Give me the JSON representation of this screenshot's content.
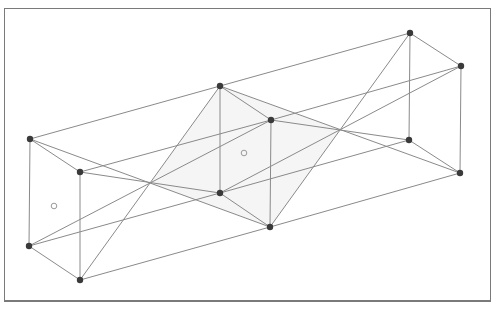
{
  "diagram": {
    "title": "",
    "frame": {
      "stroke": "#7a7a7a"
    },
    "colors": {
      "edge": "#8a8a8a",
      "vertex": "#3a3a3a",
      "shade": "#ececec",
      "marker": "#9a9a9a"
    },
    "vertices": {
      "A": [
        30,
        139
      ],
      "B": [
        220,
        86
      ],
      "C": [
        410,
        33
      ],
      "D": [
        461,
        66
      ],
      "E": [
        80,
        172
      ],
      "F": [
        271,
        120
      ],
      "J": [
        29,
        246
      ],
      "G": [
        220,
        193
      ],
      "H": [
        409,
        140
      ],
      "I": [
        460,
        173
      ],
      "K": [
        80,
        280
      ],
      "L": [
        270,
        227
      ]
    },
    "edges": [
      [
        "A",
        "B"
      ],
      [
        "B",
        "C"
      ],
      [
        "C",
        "D"
      ],
      [
        "A",
        "E"
      ],
      [
        "E",
        "F"
      ],
      [
        "F",
        "D"
      ],
      [
        "B",
        "F"
      ],
      [
        "A",
        "J"
      ],
      [
        "E",
        "K"
      ],
      [
        "B",
        "G"
      ],
      [
        "F",
        "L"
      ],
      [
        "C",
        "H"
      ],
      [
        "D",
        "I"
      ],
      [
        "J",
        "G"
      ],
      [
        "G",
        "H"
      ],
      [
        "K",
        "L"
      ],
      [
        "L",
        "I"
      ],
      [
        "J",
        "K"
      ],
      [
        "G",
        "L"
      ],
      [
        "H",
        "I"
      ],
      [
        "A",
        "L"
      ],
      [
        "B",
        "K"
      ],
      [
        "J",
        "F"
      ],
      [
        "E",
        "G"
      ],
      [
        "B",
        "I"
      ],
      [
        "C",
        "L"
      ],
      [
        "D",
        "G"
      ],
      [
        "F",
        "H"
      ]
    ],
    "shaded_region": [
      [
        150,
        183
      ],
      [
        220,
        86
      ],
      [
        340,
        130
      ],
      [
        270,
        227
      ]
    ],
    "open_markers": [
      [
        54,
        206
      ],
      [
        244,
        153
      ]
    ]
  }
}
